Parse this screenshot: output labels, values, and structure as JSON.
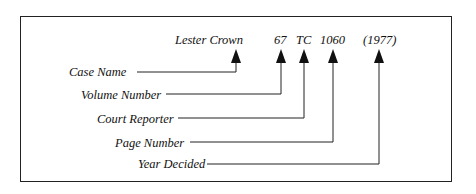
{
  "citation": {
    "case_name": "Lester Crown",
    "volume": "67",
    "reporter": "TC",
    "page": "1060",
    "year": "(1977)"
  },
  "labels": {
    "case_name": "Case Name",
    "volume_number": "Volume Number",
    "court_reporter": "Court Reporter",
    "page_number": "Page Number",
    "year_decided": "Year Decided"
  },
  "colors": {
    "line": "#222222",
    "text": "#111111"
  }
}
